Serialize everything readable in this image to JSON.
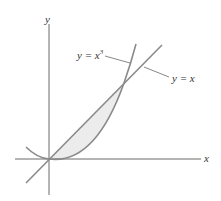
{
  "diagram": {
    "axes": {
      "x_label": "x",
      "y_label": "y"
    },
    "curves": [
      {
        "name": "cubic",
        "label_lhs": "y = x",
        "label_exp": "3"
      },
      {
        "name": "line",
        "label": "y = x"
      }
    ],
    "shaded_region": "area between y = x and y = x^3 from 0 to 1",
    "colors": {
      "axes": "#6a6a6a",
      "curve": "#8a8a8a",
      "fill": "#ececec",
      "text": "#333333"
    }
  }
}
